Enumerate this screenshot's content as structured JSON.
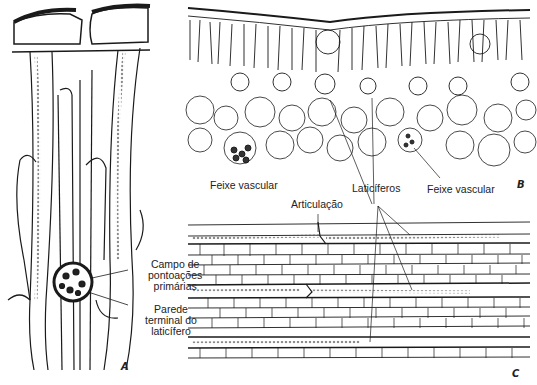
{
  "figure": {
    "panels": {
      "a": {
        "letter": "A"
      },
      "b": {
        "letter": "B"
      },
      "c": {
        "letter": "C"
      }
    },
    "labels": {
      "campo": {
        "line1": "Campo de",
        "line2": "pontoações",
        "line3": "primárias"
      },
      "parede": {
        "line1": "Parede",
        "line2": "terminal do",
        "line3": "laticífero"
      },
      "feixe_left": "Feixe vascular",
      "feixe_right": "Feixe vascular",
      "laticiferos": "Laticíferos",
      "articulacao": "Articulação"
    },
    "colors": {
      "ink": "#1a1a1a",
      "background": "#ffffff"
    }
  }
}
